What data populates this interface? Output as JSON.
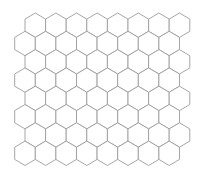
{
  "diagram": {
    "type": "hexagonal-grid",
    "orientation": "pointy-top",
    "canvas": {
      "width": 200,
      "height": 173,
      "background": "#ffffff"
    },
    "stroke_color": "#9c9c9c",
    "fill_color": "#ffffff",
    "rows": 8,
    "hexes_per_row": 8,
    "hex_width": 20.6,
    "hex_height": 24.4,
    "row_pitch": 18.3,
    "top_y": 13,
    "odd_row_start_x": 25,
    "even_row_start_x": 14.7
  }
}
